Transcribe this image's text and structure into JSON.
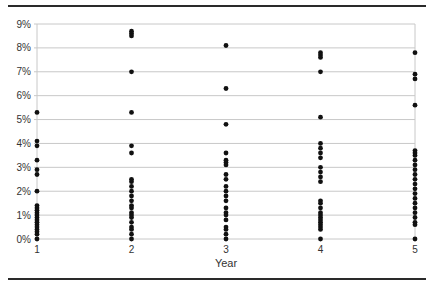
{
  "chart_data": {
    "type": "scatter",
    "title": "",
    "xlabel": "Year",
    "ylabel": "",
    "x_categories": [
      "1",
      "2",
      "3",
      "4",
      "5"
    ],
    "y_ticks": [
      "0%",
      "1%",
      "2%",
      "3%",
      "4%",
      "5%",
      "6%",
      "7%",
      "8%",
      "9%"
    ],
    "ylim": [
      0,
      9
    ],
    "y_unit": "%",
    "grid": true,
    "legend": null,
    "marker_color": "#111111",
    "grid_color": "#c8c8c8",
    "series": [
      {
        "x": 1,
        "values": [
          5.3,
          4.1,
          3.9,
          3.3,
          2.9,
          2.7,
          2.0,
          1.4,
          1.3,
          1.2,
          1.1,
          1.0,
          0.9,
          0.8,
          0.7,
          0.6,
          0.5,
          0.4,
          0.3,
          0.2,
          0.0
        ]
      },
      {
        "x": 2,
        "values": [
          8.7,
          8.6,
          8.5,
          7.0,
          5.3,
          3.9,
          3.6,
          2.5,
          2.4,
          2.2,
          2.0,
          1.8,
          1.6,
          1.4,
          1.3,
          1.1,
          1.0,
          0.9,
          0.7,
          0.5,
          0.4,
          0.2,
          0.0
        ]
      },
      {
        "x": 3,
        "values": [
          8.1,
          6.3,
          4.8,
          3.6,
          3.3,
          3.2,
          3.1,
          2.7,
          2.5,
          2.2,
          2.0,
          1.8,
          1.6,
          1.3,
          1.1,
          1.0,
          0.8,
          0.5,
          0.4,
          0.2,
          0.0
        ]
      },
      {
        "x": 4,
        "values": [
          7.8,
          7.7,
          7.6,
          7.0,
          5.1,
          4.0,
          3.8,
          3.6,
          3.4,
          3.0,
          2.8,
          2.6,
          2.4,
          1.6,
          1.5,
          1.3,
          1.1,
          1.0,
          0.9,
          0.8,
          0.7,
          0.6,
          0.5,
          0.4,
          0.0
        ]
      },
      {
        "x": 5,
        "values": [
          7.8,
          6.9,
          6.7,
          5.6,
          3.7,
          3.6,
          3.5,
          3.3,
          3.1,
          2.9,
          2.7,
          2.5,
          2.3,
          2.1,
          1.9,
          1.7,
          1.5,
          1.3,
          1.1,
          0.9,
          0.7,
          0.6,
          0.0
        ]
      }
    ]
  }
}
